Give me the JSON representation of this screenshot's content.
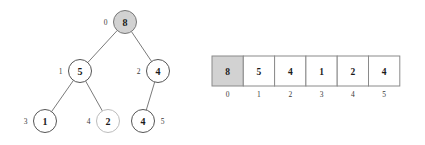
{
  "figure": {
    "colors": {
      "highlight_fill": "#d2d2d2",
      "node_stroke": "#555555",
      "faded_node_stroke": "#bcbcbc",
      "edge_stroke": "#6b6b6b",
      "cell_stroke": "#8a8a8a",
      "text": "#1a1a1a",
      "background": "#ffffff"
    }
  },
  "tree": {
    "nodes": [
      {
        "index": "0",
        "value": "8",
        "cx": 125,
        "cy": 22,
        "r": 11.5,
        "highlighted": true,
        "faded": false,
        "label_side": "left"
      },
      {
        "index": "1",
        "value": "5",
        "cx": 80,
        "cy": 71,
        "r": 11.5,
        "highlighted": false,
        "faded": false,
        "label_side": "left"
      },
      {
        "index": "2",
        "value": "4",
        "cx": 158,
        "cy": 71,
        "r": 11.5,
        "highlighted": false,
        "faded": false,
        "label_side": "left"
      },
      {
        "index": "3",
        "value": "1",
        "cx": 45,
        "cy": 121,
        "r": 11.5,
        "highlighted": false,
        "faded": false,
        "label_side": "left"
      },
      {
        "index": "4",
        "value": "2",
        "cx": 108,
        "cy": 121,
        "r": 11.5,
        "highlighted": false,
        "faded": true,
        "label_side": "left"
      },
      {
        "index": "5",
        "value": "4",
        "cx": 143,
        "cy": 121,
        "r": 11.5,
        "highlighted": false,
        "faded": false,
        "label_side": "right"
      }
    ],
    "edges": [
      {
        "from": "0",
        "to": "1"
      },
      {
        "from": "0",
        "to": "2"
      },
      {
        "from": "1",
        "to": "3"
      },
      {
        "from": "1",
        "to": "4"
      },
      {
        "from": "2",
        "to": "5"
      }
    ]
  },
  "array": {
    "x": 212,
    "y": 56,
    "cell_width": 31.3,
    "cell_height": 30,
    "index_label_y": 94,
    "cells": [
      {
        "index": "0",
        "value": "8",
        "highlighted": true
      },
      {
        "index": "1",
        "value": "5",
        "highlighted": false
      },
      {
        "index": "2",
        "value": "4",
        "highlighted": false
      },
      {
        "index": "3",
        "value": "1",
        "highlighted": false
      },
      {
        "index": "4",
        "value": "2",
        "highlighted": false
      },
      {
        "index": "5",
        "value": "4",
        "highlighted": false
      }
    ]
  }
}
